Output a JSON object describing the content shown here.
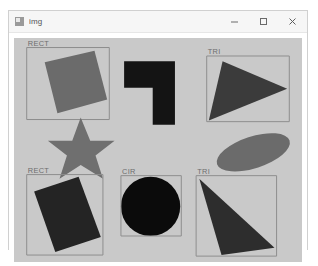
{
  "window": {
    "title": "img",
    "icon": "image-app-icon",
    "controls": [
      {
        "name": "minimize-button",
        "glyph": "minimize-icon"
      },
      {
        "name": "maximize-button",
        "glyph": "maximize-icon"
      },
      {
        "name": "close-button",
        "glyph": "close-icon"
      }
    ]
  },
  "canvas": {
    "background_color": "#c9c9c9",
    "box_stroke_color": "#8e8e8e",
    "label_color": "#6d6d6d",
    "shapes": [
      {
        "id": "rect-top-left",
        "kind": "rectangle",
        "label": "RECT",
        "color": "#6b6b6b",
        "has_box": true,
        "box": {
          "x": 12,
          "y": 9,
          "w": 78,
          "h": 68
        },
        "points": "29,23 76,12 88,58 41,71"
      },
      {
        "id": "polygon-top-center",
        "kind": "polygon",
        "label": "",
        "color": "#141414",
        "has_box": false,
        "box": null,
        "points": "104,22 152,22 152,82 131,82 131,47 104,47"
      },
      {
        "id": "triangle-top-right",
        "kind": "triangle",
        "label": "TRI",
        "color": "#3b3b3b",
        "has_box": true,
        "box": {
          "x": 182,
          "y": 17,
          "w": 78,
          "h": 62
        },
        "points": "197,22 258,48 184,78"
      },
      {
        "id": "star-middle-left",
        "kind": "star",
        "label": "",
        "color": "#6f6f6f",
        "has_box": false,
        "box": null,
        "points": "63,75 72,97 95,97 77,111 84,133 63,120 43,133 50,111 32,97 55,97"
      },
      {
        "id": "ellipse-middle-right",
        "kind": "ellipse",
        "label": "",
        "color": "#6b6b6b",
        "has_box": false,
        "box": null,
        "cx": 226,
        "cy": 108,
        "rx": 36,
        "ry": 15,
        "rotation": -18
      },
      {
        "id": "rect-bottom-left",
        "kind": "rectangle",
        "label": "RECT",
        "color": "#242424",
        "has_box": true,
        "box": {
          "x": 12,
          "y": 129,
          "w": 72,
          "h": 76
        },
        "points": "19,145 61,131 82,188 39,202"
      },
      {
        "id": "circle-bottom-center",
        "kind": "circle",
        "label": "CIR",
        "color": "#0b0b0b",
        "has_box": true,
        "box": {
          "x": 101,
          "y": 130,
          "w": 57,
          "h": 57
        },
        "cx": 129,
        "cy": 159,
        "r": 28
      },
      {
        "id": "triangle-bottom-right",
        "kind": "triangle",
        "label": "TRI",
        "color": "#2d2d2d",
        "has_box": true,
        "box": {
          "x": 172,
          "y": 130,
          "w": 76,
          "h": 76
        },
        "points": "175,133 246,198 196,205"
      }
    ]
  }
}
